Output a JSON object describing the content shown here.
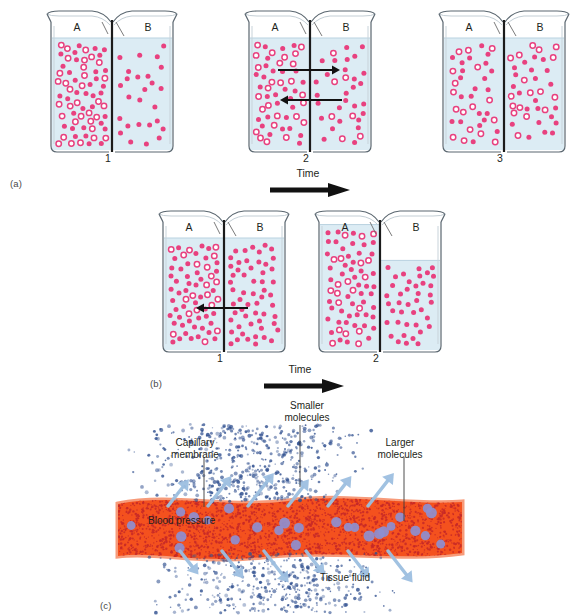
{
  "figure": {
    "panels": [
      {
        "id": "a",
        "label": "(a)",
        "process": "diffusion",
        "time_label": "Time",
        "beakers": [
          {
            "step": "1",
            "side_a_label": "A",
            "side_b_label": "B",
            "side_a_level_pct": 100,
            "side_b_level_pct": 100,
            "side_a_solid_dots": 34,
            "side_a_open_dots": 33,
            "side_b_solid_dots": 26,
            "side_b_open_dots": 0,
            "arrows": []
          },
          {
            "step": "2",
            "side_a_label": "A",
            "side_b_label": "B",
            "side_a_level_pct": 100,
            "side_b_level_pct": 100,
            "side_a_solid_dots": 28,
            "side_a_open_dots": 26,
            "side_b_solid_dots": 28,
            "side_b_open_dots": 7,
            "arrows": [
              "right",
              "left"
            ]
          },
          {
            "step": "3",
            "side_a_label": "A",
            "side_b_label": "B",
            "side_a_level_pct": 100,
            "side_b_level_pct": 100,
            "side_a_solid_dots": 22,
            "side_a_open_dots": 17,
            "side_b_solid_dots": 22,
            "side_b_open_dots": 17,
            "arrows": []
          }
        ]
      },
      {
        "id": "b",
        "label": "(b)",
        "process": "osmosis",
        "time_label": "Time",
        "beakers": [
          {
            "step": "1",
            "side_a_label": "A",
            "side_b_label": "B",
            "side_a_level_pct": 100,
            "side_b_level_pct": 100,
            "side_a_solid_dots": 46,
            "side_a_open_dots": 20,
            "side_b_solid_dots": 56,
            "side_b_open_dots": 0,
            "arrows": [
              "left"
            ]
          },
          {
            "step": "2",
            "side_a_label": "A",
            "side_b_label": "B",
            "side_a_level_pct": 112,
            "side_b_level_pct": 80,
            "side_a_solid_dots": 48,
            "side_a_open_dots": 20,
            "side_b_solid_dots": 40,
            "side_b_open_dots": 0,
            "arrows": []
          }
        ]
      },
      {
        "id": "c",
        "label": "(c)",
        "process": "filtration",
        "labels": {
          "capillary_membrane": "Capillary\nmembrane",
          "smaller_molecules": "Smaller\nmolecules",
          "larger_molecules": "Larger\nmolecules",
          "blood_pressure": "Blood pressure",
          "tissue_fluid": "Tissue fluid"
        }
      }
    ]
  },
  "colors": {
    "solute_solid": "#e8417f",
    "solute_open_stroke": "#e8417f",
    "water_fill": "#dcecf4",
    "glass_stroke": "#5b6770",
    "membrane": "#1b1b1b",
    "arrow": "#111111",
    "capillary_body": "#f4511e",
    "capillary_stipple": "#c62828",
    "capillary_membrane_edge": "#f79b7a",
    "large_molecule": "#8e8fd0",
    "small_molecule": "#2f4f8f",
    "flow_arrow": "#9dbfe0",
    "text": "#231f20"
  }
}
